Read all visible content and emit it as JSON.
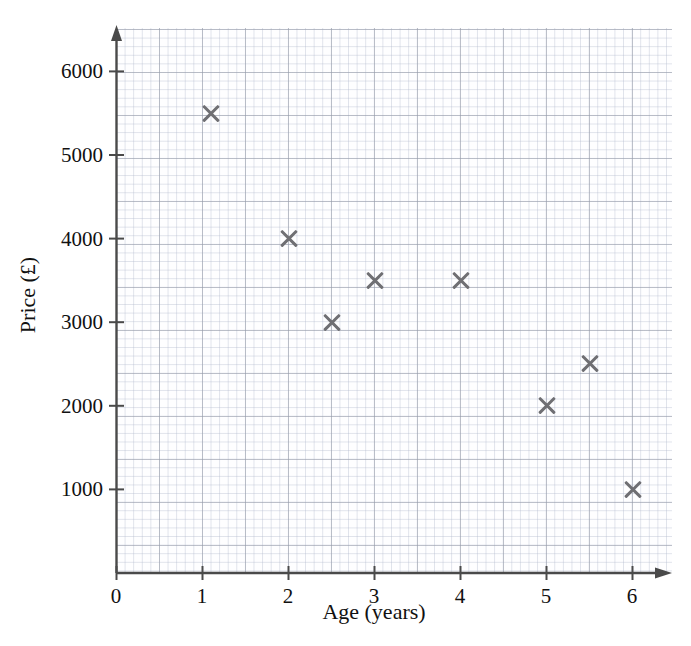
{
  "chart_data": {
    "type": "scatter",
    "title": "",
    "xlabel": "Age (years)",
    "ylabel": "Price (£)",
    "xlim": [
      0,
      6.5
    ],
    "ylim": [
      0,
      6500
    ],
    "xticks": [
      "0",
      "1",
      "2",
      "3",
      "4",
      "5",
      "6"
    ],
    "xtick_values": [
      0,
      1,
      2,
      3,
      4,
      5,
      6
    ],
    "yticks": [
      "1000",
      "2000",
      "3000",
      "4000",
      "5000",
      "6000"
    ],
    "ytick_values": [
      1000,
      2000,
      3000,
      4000,
      5000,
      6000
    ],
    "grid": "graph-paper minor 0.1 units, major 0.5 units",
    "legend": "none",
    "marker": "x",
    "marker_color": "#6f6f73",
    "x": [
      1.1,
      2.0,
      2.5,
      3.0,
      4.0,
      5.0,
      5.5,
      6.0
    ],
    "y": [
      5500,
      4000,
      3000,
      3500,
      3500,
      2000,
      2500,
      1000
    ],
    "points": [
      {
        "x": 1.1,
        "y": 5500
      },
      {
        "x": 2.0,
        "y": 4000
      },
      {
        "x": 2.5,
        "y": 3000
      },
      {
        "x": 3.0,
        "y": 3500
      },
      {
        "x": 4.0,
        "y": 3500
      },
      {
        "x": 5.0,
        "y": 2000
      },
      {
        "x": 5.5,
        "y": 2500
      },
      {
        "x": 6.0,
        "y": 1000
      }
    ]
  },
  "axes": {
    "x_axis_name": "x-axis",
    "y_axis_name": "y-axis",
    "axis_color": "#444444"
  }
}
